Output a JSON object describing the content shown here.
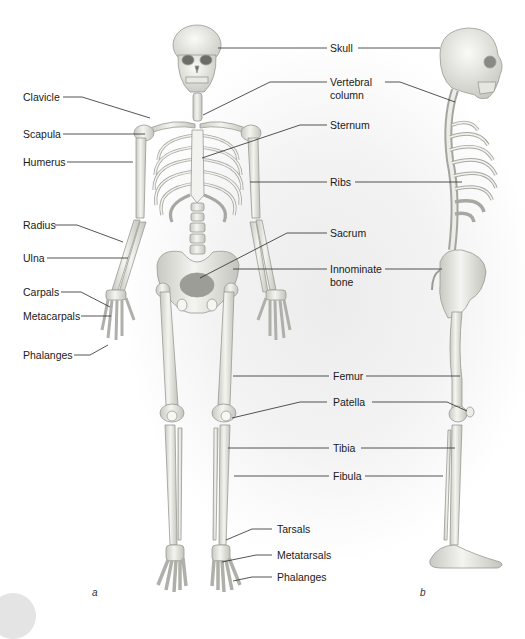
{
  "figure": {
    "panels": [
      {
        "id": "a",
        "label": "a",
        "view": "anterior"
      },
      {
        "id": "b",
        "label": "b",
        "view": "lateral"
      }
    ],
    "left_labels": {
      "clavicle": "Clavicle",
      "scapula": "Scapula",
      "humerus": "Humerus",
      "radius": "Radius",
      "ulna": "Ulna",
      "carpals": "Carpals",
      "metacarpals": "Metacarpals",
      "phalanges_hand": "Phalanges"
    },
    "center_labels": {
      "skull": "Skull",
      "vertebral_column_1": "Vertebral",
      "vertebral_column_2": "column",
      "sternum": "Sternum",
      "ribs": "Ribs",
      "sacrum": "Sacrum",
      "innominate_1": "Innominate",
      "innominate_2": "bone",
      "femur": "Femur",
      "patella": "Patella",
      "tibia": "Tibia",
      "fibula": "Fibula",
      "tarsals": "Tarsals",
      "metatarsals": "Metatarsals",
      "phalanges_foot": "Phalanges"
    },
    "colors": {
      "bone": "#ebebe6",
      "bone_shadow": "#b9b9b3",
      "leader_line": "#2a2a2a",
      "text": "#1a1a1a"
    }
  }
}
